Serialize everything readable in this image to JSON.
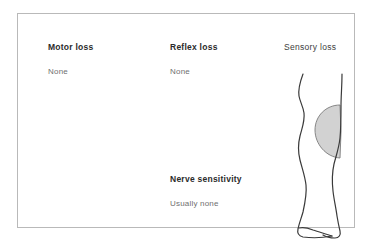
{
  "card": {
    "border_color": "#b9b9b9",
    "background": "#ffffff"
  },
  "columns": {
    "motor": {
      "heading": "Motor loss",
      "value": "None"
    },
    "reflex": {
      "heading": "Reflex loss",
      "value": "None"
    },
    "sensory": {
      "heading": "Sensory loss"
    },
    "nerve": {
      "heading": "Nerve sensitivity",
      "value": "Usually none"
    }
  },
  "figure": {
    "name": "leg-side-view-diagram",
    "outline_color": "#3a3a3a",
    "shaded_region": {
      "name": "sensory-loss-region",
      "fill_color": "#d2d2d2",
      "stroke_color": "#7a7a7a"
    }
  }
}
